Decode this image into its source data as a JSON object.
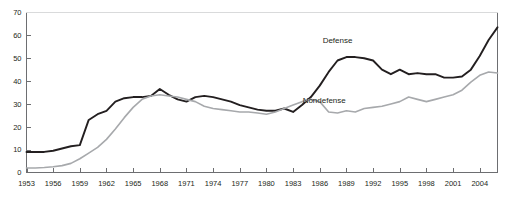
{
  "chart_data": {
    "type": "line",
    "title": "",
    "xlabel": "",
    "ylabel": "",
    "xlim": [
      1953,
      2006
    ],
    "ylim": [
      0,
      70
    ],
    "grid": false,
    "legend_position": "inline-annotation",
    "y_ticks": [
      0,
      10,
      20,
      30,
      40,
      50,
      60,
      70
    ],
    "x_ticks": [
      1953,
      1956,
      1959,
      1962,
      1965,
      1968,
      1971,
      1974,
      1977,
      1980,
      1983,
      1986,
      1989,
      1992,
      1995,
      1998,
      2001,
      2004
    ],
    "x": [
      1953,
      1954,
      1955,
      1956,
      1957,
      1958,
      1959,
      1960,
      1961,
      1962,
      1963,
      1964,
      1965,
      1966,
      1967,
      1968,
      1969,
      1970,
      1971,
      1972,
      1973,
      1974,
      1975,
      1976,
      1977,
      1978,
      1979,
      1980,
      1981,
      1982,
      1983,
      1984,
      1985,
      1986,
      1987,
      1988,
      1989,
      1990,
      1991,
      1992,
      1993,
      1994,
      1995,
      1996,
      1997,
      1998,
      1999,
      2000,
      2001,
      2002,
      2003,
      2004,
      2005,
      2006
    ],
    "series": [
      {
        "name": "Defense",
        "color": "#231f20",
        "values": [
          9.0,
          9.0,
          9.0,
          9.5,
          10.5,
          11.5,
          12.0,
          23.0,
          25.5,
          27.0,
          31.0,
          32.5,
          33.0,
          33.0,
          33.5,
          36.5,
          34.0,
          32.0,
          31.0,
          33.0,
          33.5,
          33.0,
          32.0,
          31.0,
          29.5,
          28.5,
          27.5,
          27.0,
          27.0,
          28.0,
          26.5,
          29.5,
          33.0,
          38.0,
          44.0,
          49.0,
          50.5,
          50.5,
          50.0,
          49.0,
          45.0,
          43.0,
          45.0,
          43.0,
          43.5,
          43.0,
          43.0,
          41.5,
          41.5,
          42.0,
          45.0,
          51.0,
          58.0,
          63.5
        ]
      },
      {
        "name": "Nondefense",
        "color": "#a7a9ac",
        "values": [
          2.0,
          2.0,
          2.2,
          2.5,
          3.0,
          4.0,
          6.0,
          8.5,
          11.0,
          14.5,
          19.0,
          24.0,
          28.5,
          32.0,
          33.5,
          34.0,
          33.5,
          33.0,
          32.0,
          31.0,
          29.0,
          28.0,
          27.5,
          27.0,
          26.5,
          26.5,
          26.0,
          25.5,
          26.5,
          28.0,
          29.5,
          31.0,
          32.0,
          31.0,
          26.5,
          26.0,
          27.0,
          26.5,
          28.0,
          28.5,
          29.0,
          30.0,
          31.0,
          33.0,
          32.0,
          31.0,
          32.0,
          33.0,
          34.0,
          36.0,
          39.5,
          42.5,
          44.0,
          43.5
        ]
      }
    ],
    "annotations": [
      {
        "text": "Defense",
        "x": 1988,
        "y": 56.5
      },
      {
        "text": "Nondefense",
        "x": 1986.5,
        "y": 30.5
      }
    ]
  }
}
